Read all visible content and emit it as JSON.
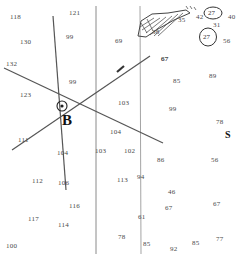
{
  "map": {
    "title": "survey-parcel-map",
    "width": 238,
    "height": 254,
    "background_color": "#ffffff",
    "line_color": "#555555",
    "text_color": "#4a4a4a"
  },
  "labels": {
    "station_b": "B",
    "marker_s": "S"
  },
  "annotations": {
    "circled_27_top": "27",
    "circled_27_lower": "27"
  },
  "spot_values": [
    {
      "text": "118",
      "x": 10,
      "y": 14
    },
    {
      "text": "121",
      "x": 69,
      "y": 10
    },
    {
      "text": "130",
      "x": 20,
      "y": 39
    },
    {
      "text": "99",
      "x": 66,
      "y": 34
    },
    {
      "text": "69",
      "x": 115,
      "y": 38
    },
    {
      "text": "132",
      "x": 6,
      "y": 61
    },
    {
      "text": "67",
      "x": 161,
      "y": 56
    },
    {
      "text": "99",
      "x": 69,
      "y": 79
    },
    {
      "text": "85",
      "x": 173,
      "y": 78
    },
    {
      "text": "89",
      "x": 209,
      "y": 73
    },
    {
      "text": "123",
      "x": 20,
      "y": 92
    },
    {
      "text": "103",
      "x": 118,
      "y": 100
    },
    {
      "text": "99",
      "x": 169,
      "y": 106
    },
    {
      "text": "78",
      "x": 216,
      "y": 119
    },
    {
      "text": "104",
      "x": 110,
      "y": 129
    },
    {
      "text": "111",
      "x": 18,
      "y": 137
    },
    {
      "text": "103",
      "x": 95,
      "y": 148
    },
    {
      "text": "102",
      "x": 124,
      "y": 148
    },
    {
      "text": "104",
      "x": 57,
      "y": 150
    },
    {
      "text": "86",
      "x": 157,
      "y": 157
    },
    {
      "text": "56",
      "x": 211,
      "y": 157
    },
    {
      "text": "112",
      "x": 32,
      "y": 178
    },
    {
      "text": "106",
      "x": 58,
      "y": 180
    },
    {
      "text": "113",
      "x": 117,
      "y": 177
    },
    {
      "text": "94",
      "x": 137,
      "y": 174
    },
    {
      "text": "46",
      "x": 168,
      "y": 189
    },
    {
      "text": "67",
      "x": 213,
      "y": 201
    },
    {
      "text": "116",
      "x": 69,
      "y": 203
    },
    {
      "text": "117",
      "x": 28,
      "y": 216
    },
    {
      "text": "114",
      "x": 58,
      "y": 222
    },
    {
      "text": "61",
      "x": 138,
      "y": 214
    },
    {
      "text": "67",
      "x": 165,
      "y": 205
    },
    {
      "text": "100",
      "x": 6,
      "y": 243
    },
    {
      "text": "78",
      "x": 118,
      "y": 234
    },
    {
      "text": "85",
      "x": 143,
      "y": 241
    },
    {
      "text": "92",
      "x": 170,
      "y": 246
    },
    {
      "text": "85",
      "x": 192,
      "y": 240
    },
    {
      "text": "77",
      "x": 216,
      "y": 236
    }
  ],
  "top_right_cluster": [
    {
      "text": "35",
      "x": 178,
      "y": 17
    },
    {
      "text": "38",
      "x": 152,
      "y": 29
    },
    {
      "text": "42",
      "x": 196,
      "y": 14
    },
    {
      "text": "40",
      "x": 228,
      "y": 14
    },
    {
      "text": "31",
      "x": 213,
      "y": 22
    },
    {
      "text": "56",
      "x": 223,
      "y": 38
    },
    {
      "text": "67",
      "x": 161,
      "y": 56
    }
  ]
}
